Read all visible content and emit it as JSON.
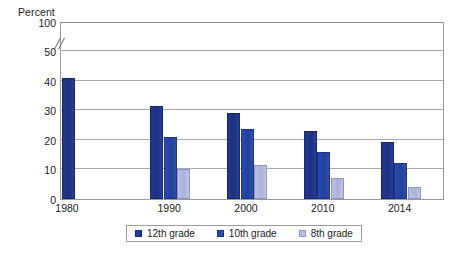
{
  "chart_data": {
    "type": "bar",
    "title": "",
    "subtitle": "",
    "xlabel": "",
    "ylabel": "Percent",
    "ylim": [
      0,
      50
    ],
    "yticks": [
      0,
      10,
      20,
      30,
      40,
      50,
      100
    ],
    "ytick_labels": [
      "0",
      "10",
      "20",
      "30",
      "40",
      "50",
      "100"
    ],
    "axis_break": {
      "between": [
        50,
        100
      ],
      "marker": "double-slash"
    },
    "grid": "horizontal",
    "legend_position": "bottom-center",
    "categories": [
      "1980",
      "1990",
      "2000",
      "2010",
      "2014"
    ],
    "series": [
      {
        "name": "12th grade",
        "color": "#1f3a93",
        "values": [
          40.8,
          31.5,
          29.1,
          23.0,
          19.2
        ]
      },
      {
        "name": "10th grade",
        "color": "#2b4bb0",
        "values": [
          null,
          21.0,
          23.5,
          16.0,
          12.2
        ]
      },
      {
        "name": "8th grade",
        "color": "#b9bfe2",
        "values": [
          null,
          10.3,
          11.5,
          7.0,
          4.0
        ]
      }
    ]
  },
  "axis": {
    "y_title": "Percent"
  },
  "legend": {
    "items": [
      {
        "label": "12th grade",
        "color": "#1f3a93"
      },
      {
        "label": "10th grade",
        "color": "#2b4bb0"
      },
      {
        "label": "8th grade",
        "color": "#b9bfe2"
      }
    ]
  },
  "colors": {
    "grid": "#a8a8a8",
    "frame": "#9a9a9a",
    "text": "#1a1a1a",
    "background": "#ffffff"
  }
}
